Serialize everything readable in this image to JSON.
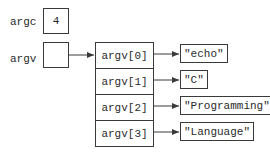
{
  "variables": [
    {
      "name": "argc",
      "value": "4"
    },
    {
      "name": "argv",
      "value": ""
    }
  ],
  "array": {
    "cells": [
      "argv[0]",
      "argv[1]",
      "argv[2]",
      "argv[3]"
    ]
  },
  "strings": [
    "\"echo\"",
    "\"C\"",
    "\"Programming\"",
    "\"Language\""
  ],
  "colors": {
    "line": "#3a3a3a",
    "text": "#2a2a2a",
    "background": "#ffffff"
  }
}
